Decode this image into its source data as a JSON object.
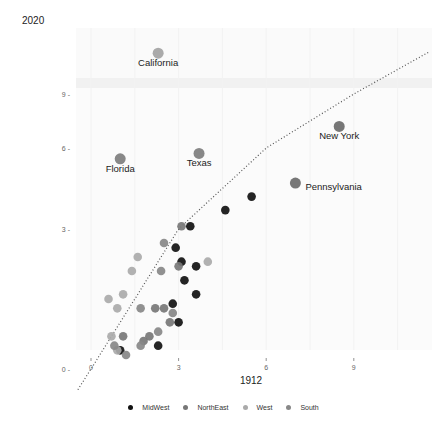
{
  "chart_data": {
    "type": "scatter",
    "title": "2020",
    "xlabel": "1912",
    "ylabel": "2020",
    "x_ticks": [
      "0",
      "3",
      "6",
      "9"
    ],
    "y_ticks": [
      "0",
      "3",
      "6",
      "9"
    ],
    "xlim": [
      -0.5,
      11.5
    ],
    "ylim": [
      -0.5,
      12
    ],
    "grid": true,
    "legend_position": "bottom",
    "reference_line": "y = x (dotted)",
    "legend": [
      {
        "name": "MidWest",
        "color": "#111111"
      },
      {
        "name": "NorthEast",
        "color": "#777777"
      },
      {
        "name": "West",
        "color": "#aaaaaa"
      },
      {
        "name": "South",
        "color": "#888888"
      }
    ],
    "labeled_points": [
      {
        "label": "California",
        "region": "West",
        "x": 2.3,
        "y": 11.5
      },
      {
        "label": "New York",
        "region": "NorthEast",
        "x": 8.5,
        "y": 7.2
      },
      {
        "label": "Florida",
        "region": "South",
        "x": 1.0,
        "y": 5.6
      },
      {
        "label": "Texas",
        "region": "South",
        "x": 3.7,
        "y": 5.8
      },
      {
        "label": "Pennsylvania",
        "region": "NorthEast",
        "x": 7.0,
        "y": 4.7
      }
    ],
    "points": [
      {
        "region": "MidWest",
        "x": 5.5,
        "y": 4.2
      },
      {
        "region": "MidWest",
        "x": 4.6,
        "y": 3.7
      },
      {
        "region": "MidWest",
        "x": 3.4,
        "y": 3.1
      },
      {
        "region": "MidWest",
        "x": 2.9,
        "y": 2.6
      },
      {
        "region": "MidWest",
        "x": 3.1,
        "y": 2.3
      },
      {
        "region": "MidWest",
        "x": 3.6,
        "y": 2.2
      },
      {
        "region": "MidWest",
        "x": 3.2,
        "y": 1.9
      },
      {
        "region": "MidWest",
        "x": 3.6,
        "y": 1.6
      },
      {
        "region": "MidWest",
        "x": 2.8,
        "y": 1.4
      },
      {
        "region": "MidWest",
        "x": 3.0,
        "y": 1.0
      },
      {
        "region": "MidWest",
        "x": 2.3,
        "y": 0.5
      },
      {
        "region": "MidWest",
        "x": 1.0,
        "y": 0.4
      },
      {
        "region": "NorthEast",
        "x": 3.1,
        "y": 3.1
      },
      {
        "region": "NorthEast",
        "x": 3.0,
        "y": 2.2
      },
      {
        "region": "NorthEast",
        "x": 2.5,
        "y": 1.3
      },
      {
        "region": "NorthEast",
        "x": 2.2,
        "y": 1.3
      },
      {
        "region": "NorthEast",
        "x": 2.7,
        "y": 1.0
      },
      {
        "region": "NorthEast",
        "x": 2.0,
        "y": 0.7
      },
      {
        "region": "NorthEast",
        "x": 1.8,
        "y": 0.6
      },
      {
        "region": "NorthEast",
        "x": 1.1,
        "y": 0.7
      },
      {
        "region": "West",
        "x": 4.0,
        "y": 2.3
      },
      {
        "region": "West",
        "x": 1.6,
        "y": 2.4
      },
      {
        "region": "West",
        "x": 1.4,
        "y": 2.1
      },
      {
        "region": "West",
        "x": 0.6,
        "y": 1.5
      },
      {
        "region": "West",
        "x": 1.1,
        "y": 1.6
      },
      {
        "region": "West",
        "x": 0.9,
        "y": 1.3
      },
      {
        "region": "West",
        "x": 0.7,
        "y": 0.7
      },
      {
        "region": "West",
        "x": 0.9,
        "y": 0.4
      },
      {
        "region": "South",
        "x": 2.5,
        "y": 2.7
      },
      {
        "region": "South",
        "x": 2.4,
        "y": 2.1
      },
      {
        "region": "South",
        "x": 1.7,
        "y": 1.3
      },
      {
        "region": "South",
        "x": 2.8,
        "y": 1.2
      },
      {
        "region": "South",
        "x": 2.3,
        "y": 0.8
      },
      {
        "region": "South",
        "x": 1.7,
        "y": 0.5
      },
      {
        "region": "South",
        "x": 0.8,
        "y": 0.5
      },
      {
        "region": "South",
        "x": 1.2,
        "y": 0.3
      }
    ]
  },
  "panel": {
    "background": "#fafafa",
    "grid_color": "#f0f0f0"
  },
  "colors": {
    "MidWest": "#111111",
    "NorthEast": "#777777",
    "West": "#aaaaaa",
    "South": "#888888"
  }
}
